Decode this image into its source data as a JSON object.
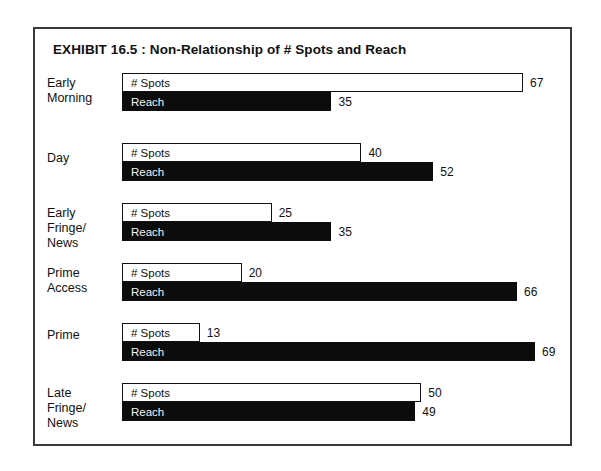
{
  "exhibit": {
    "title": "EXHIBIT 16.5 :  Non-Relationship of # Spots and Reach"
  },
  "chart_data": {
    "type": "bar",
    "orientation": "horizontal",
    "title": "EXHIBIT 16.5 :  Non-Relationship of # Spots and Reach",
    "xlabel": "",
    "ylabel": "",
    "xlim": [
      0,
      70
    ],
    "grid": false,
    "legend": "in-bar labels",
    "categories": [
      "Early Morning",
      "Day",
      "Early Fringe/ News",
      "Prime Access",
      "Prime",
      "Late Fringe/ News"
    ],
    "series": [
      {
        "name": "# Spots",
        "values": [
          67,
          40,
          25,
          20,
          13,
          50
        ],
        "fill": "#ffffff",
        "stroke": "#111111"
      },
      {
        "name": "Reach",
        "values": [
          35,
          52,
          35,
          66,
          69,
          49
        ],
        "fill": "#0c0c0c",
        "stroke": "#0c0c0c"
      }
    ]
  },
  "rows": [
    {
      "label_lines": [
        "Early",
        "Morning"
      ],
      "spots": {
        "name": "# Spots",
        "value": 67,
        "value_text": "67"
      },
      "reach": {
        "name": "Reach",
        "value": 35,
        "value_text": "35"
      }
    },
    {
      "label_lines": [
        "Day"
      ],
      "spots": {
        "name": "# Spots",
        "value": 40,
        "value_text": "40"
      },
      "reach": {
        "name": "Reach",
        "value": 52,
        "value_text": "52"
      }
    },
    {
      "label_lines": [
        "Early",
        "Fringe/",
        "News"
      ],
      "spots": {
        "name": "# Spots",
        "value": 25,
        "value_text": "25"
      },
      "reach": {
        "name": "Reach",
        "value": 35,
        "value_text": "35"
      }
    },
    {
      "label_lines": [
        "Prime",
        "Access"
      ],
      "spots": {
        "name": "# Spots",
        "value": 20,
        "value_text": "20"
      },
      "reach": {
        "name": "Reach",
        "value": 66,
        "value_text": "66"
      }
    },
    {
      "label_lines": [
        "Prime"
      ],
      "spots": {
        "name": "# Spots",
        "value": 13,
        "value_text": "13"
      },
      "reach": {
        "name": "Reach",
        "value": 69,
        "value_text": "69"
      }
    },
    {
      "label_lines": [
        "Late",
        "Fringe/",
        "News"
      ],
      "spots": {
        "name": "# Spots",
        "value": 50,
        "value_text": "50"
      },
      "reach": {
        "name": "Reach",
        "value": 49,
        "value_text": "49"
      }
    }
  ],
  "layout": {
    "px_per_unit": 5.985,
    "bar_origin_x": 33,
    "row_tops": [
      44,
      114,
      174,
      234,
      294,
      354
    ],
    "label_tops": [
      47,
      122,
      177,
      237,
      299,
      357
    ],
    "min_bar_px": 72
  },
  "colors": {
    "frame": "#3a3a3a",
    "spots_fill": "#ffffff",
    "reach_fill": "#0c0c0c",
    "text": "#111111",
    "reach_text": "#f2f2f2"
  }
}
